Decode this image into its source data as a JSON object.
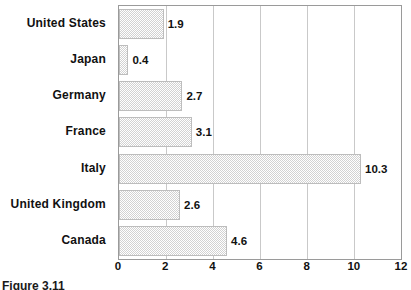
{
  "chart_data": {
    "type": "bar",
    "orientation": "horizontal",
    "title": "",
    "subtitle": "",
    "xlabel": "",
    "ylabel": "",
    "categories": [
      "United  States",
      "Japan",
      "Germany",
      "France",
      "Italy",
      "United  Kingdom",
      "Canada"
    ],
    "values": [
      1.9,
      0.4,
      2.7,
      3.1,
      10.3,
      2.6,
      4.6
    ],
    "value_labels": [
      "1.9",
      "0.4",
      "2.7",
      "3.1",
      "10.3",
      "2.6",
      "4.6"
    ],
    "xlim": [
      0,
      12
    ],
    "xticks": [
      0,
      2,
      4,
      6,
      8,
      10,
      12
    ],
    "xtick_labels": [
      "0",
      "2",
      "4",
      "6",
      "8",
      "10",
      "12"
    ],
    "grid": true,
    "grid_axis": "x",
    "legend": false,
    "legend_position": "none",
    "bar_fill": "#d2d2d2",
    "bar_pattern": "fine-dither-checker",
    "bar_border_color": "#bdbdbd",
    "grid_color": "#c9c9c9",
    "axis_color": "#9a9a9a",
    "text_color": "#111111"
  },
  "caption": {
    "text": "Figure 3.11"
  }
}
